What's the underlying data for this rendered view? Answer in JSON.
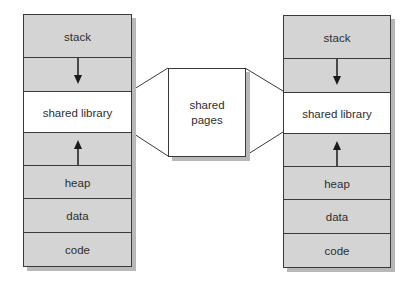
{
  "diagram": {
    "process_left": {
      "segments": [
        {
          "label": "stack",
          "style": "gray"
        },
        {
          "label": "",
          "style": "gray",
          "arrow": "down"
        },
        {
          "label": "shared library",
          "style": "white"
        },
        {
          "label": "",
          "style": "gray",
          "arrow": "up"
        },
        {
          "label": "heap",
          "style": "gray"
        },
        {
          "label": "data",
          "style": "gray"
        },
        {
          "label": "code",
          "style": "gray"
        }
      ]
    },
    "process_right": {
      "segments": [
        {
          "label": "stack",
          "style": "gray"
        },
        {
          "label": "",
          "style": "gray",
          "arrow": "down"
        },
        {
          "label": "shared library",
          "style": "white"
        },
        {
          "label": "",
          "style": "gray",
          "arrow": "up"
        },
        {
          "label": "heap",
          "style": "gray"
        },
        {
          "label": "data",
          "style": "gray"
        },
        {
          "label": "code",
          "style": "gray"
        }
      ]
    },
    "shared_pages": {
      "line1": "shared",
      "line2": "pages"
    },
    "colors": {
      "segment_fill": "#d4d4d4",
      "shared_fill": "#ffffff",
      "border": "#3a3a3a",
      "text": "#2e2e2e"
    }
  }
}
